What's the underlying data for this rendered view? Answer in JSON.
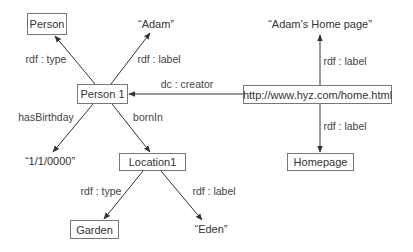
{
  "diagram": {
    "type": "rdf-graph",
    "nodes": {
      "person": {
        "label": "Person",
        "kind": "resource"
      },
      "adam": {
        "label": "“Adam”",
        "kind": "literal"
      },
      "person1": {
        "label": "Person 1",
        "kind": "resource"
      },
      "url": {
        "label": "http://www.hyz.com/home.html",
        "kind": "resource"
      },
      "homepage_label": {
        "label": "“Adam’s Home page”",
        "kind": "literal"
      },
      "homepage": {
        "label": "Homepage",
        "kind": "resource"
      },
      "birthday": {
        "label": "“1/1/0000”",
        "kind": "literal"
      },
      "location1": {
        "label": "Location1",
        "kind": "resource"
      },
      "garden": {
        "label": "Garden",
        "kind": "resource"
      },
      "eden": {
        "label": "“Eden”",
        "kind": "literal"
      }
    },
    "edges": {
      "p1_type": {
        "from": "Person 1",
        "to": "Person",
        "label": "rdf : type"
      },
      "p1_label": {
        "from": "Person 1",
        "to": "“Adam”",
        "label": "rdf : label"
      },
      "creator": {
        "from": "http://www.hyz.com/home.html",
        "to": "Person 1",
        "label": "dc : creator"
      },
      "url_label_up": {
        "from": "http://www.hyz.com/home.html",
        "to": "“Adam’s Home page”",
        "label": "rdf : label"
      },
      "url_label_down": {
        "from": "http://www.hyz.com/home.html",
        "to": "Homepage",
        "label": "rdf : label"
      },
      "birthday": {
        "from": "Person 1",
        "to": "“1/1/0000”",
        "label": "hasBirthday"
      },
      "bornin": {
        "from": "Person 1",
        "to": "Location1",
        "label": "bornIn"
      },
      "loc_type": {
        "from": "Location1",
        "to": "Garden",
        "label": "rdf : type"
      },
      "loc_label": {
        "from": "Location1",
        "to": "“Eden”",
        "label": "rdf : label"
      }
    }
  },
  "colors": {
    "line": "#333333",
    "box_border": "#777777",
    "text": "#333333"
  }
}
